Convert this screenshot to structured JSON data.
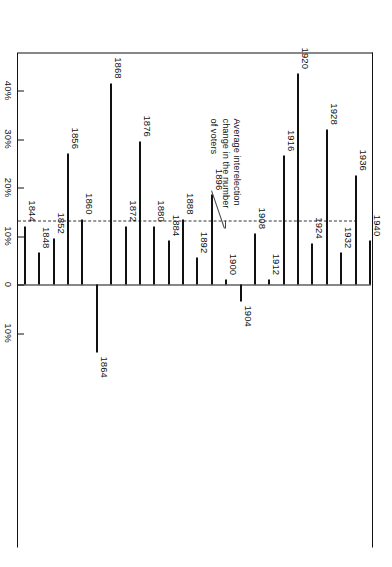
{
  "figure": {
    "annotation": "Average interelection\nchange in the number\nof voters",
    "increase_label": "Increase",
    "decrease_label": "Decrease",
    "zero_label": "0"
  },
  "chart_data": {
    "type": "bar",
    "title": "",
    "subtitle": "",
    "orientation": "horizontal-rotated",
    "xlabel": "",
    "ylabel": "Average interelection change in the number of voters",
    "axis_ticks": [
      "40%",
      "30%",
      "20%",
      "10%",
      "0",
      "10%"
    ],
    "axis_tick_values": [
      40,
      30,
      20,
      10,
      0,
      -10
    ],
    "xlim": [
      -18,
      46
    ],
    "grid": false,
    "legend": "none",
    "direction_left": "Increase",
    "direction_right": "Decrease",
    "average_line_value": 13.2,
    "annotations": [
      {
        "text": "Average interelection change in the number of voters",
        "points_to": "average-dashed-line"
      }
    ],
    "categories": [
      "1844",
      "1848",
      "1852",
      "1856",
      "1860",
      "1864",
      "1868",
      "1872",
      "1876",
      "1880",
      "1884",
      "1888",
      "1892",
      "1896",
      "1900",
      "1904",
      "1908",
      "1912",
      "1916",
      "1920",
      "1924",
      "1928",
      "1932",
      "1936",
      "1940"
    ],
    "values": [
      12.0,
      6.5,
      9.5,
      27.0,
      13.5,
      -14.0,
      41.5,
      12.0,
      29.5,
      12.0,
      9.0,
      13.5,
      5.5,
      18.5,
      1.0,
      -3.5,
      10.5,
      1.0,
      26.5,
      43.5,
      8.5,
      32.0,
      6.5,
      22.5,
      9.0
    ],
    "value_unit": "%"
  }
}
